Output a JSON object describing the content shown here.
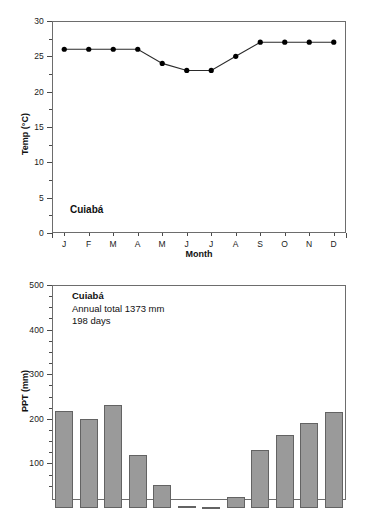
{
  "figure": {
    "site": "Cuiabá"
  },
  "temp_chart": {
    "site_label": "Cuiabá",
    "ytitle": "Temp (°C)",
    "xtitle": "Month",
    "yticks": [
      "0",
      "5",
      "10",
      "15",
      "20",
      "25",
      "30"
    ],
    "xticks": [
      "J",
      "F",
      "M",
      "A",
      "M",
      "J",
      "J",
      "A",
      "S",
      "O",
      "N",
      "D"
    ]
  },
  "ppt_chart": {
    "ytitle": "PPT (mm)",
    "yticks": [
      "0",
      "100",
      "200",
      "300",
      "400",
      "500"
    ],
    "annotation": {
      "line1": "Cuiabá",
      "line2": "Annual total 1373 mm",
      "line3": "198 days"
    }
  },
  "chart_data": [
    {
      "type": "line",
      "title": "Cuiabá",
      "xlabel": "Month",
      "ylabel": "Temp (°C)",
      "categories": [
        "J",
        "F",
        "M",
        "A",
        "M",
        "J",
        "J",
        "A",
        "S",
        "O",
        "N",
        "D"
      ],
      "values": [
        26.0,
        26.0,
        26.0,
        26.0,
        24.0,
        23.0,
        23.0,
        25.0,
        27.0,
        27.0,
        27.0,
        27.0
      ],
      "ylim": [
        0,
        30
      ],
      "ytick_step": 5,
      "minor_ytick_step": 2.5,
      "grid": false,
      "marker": "filled-circle",
      "line_color": "#2b2b2b",
      "marker_color": "#000000",
      "legend": "none"
    },
    {
      "type": "bar",
      "title": "Cuiabá",
      "xlabel": "Month",
      "ylabel": "PPT (mm)",
      "categories": [
        "J",
        "F",
        "M",
        "A",
        "M",
        "J",
        "J",
        "A",
        "S",
        "O",
        "N",
        "D"
      ],
      "values": [
        218,
        199,
        230,
        118,
        52,
        5,
        3,
        25,
        130,
        163,
        191,
        215
      ],
      "ylim": [
        0,
        500
      ],
      "ytick_step": 100,
      "minor_ytick_step": 25,
      "grid": false,
      "bar_color": "#9a9a9a",
      "bar_edge_color": "#636363",
      "annotations": [
        "Cuiabá",
        "Annual total 1373 mm",
        "198 days"
      ],
      "note": "lower axis cropped by image bottom edge",
      "legend": "none"
    }
  ]
}
